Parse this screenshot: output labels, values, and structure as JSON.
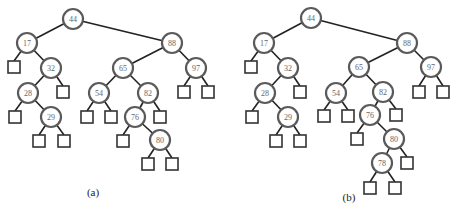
{
  "figure": {
    "trees": [
      {
        "label": "(a)",
        "label_pos": [
          93,
          196
        ],
        "nodes": [
          {
            "id": "44",
            "label": "44",
            "x": 73,
            "y": 19
          },
          {
            "id": "17",
            "label": "17",
            "x": 27,
            "y": 43
          },
          {
            "id": "32",
            "label": "32",
            "x": 51,
            "y": 68
          },
          {
            "id": "28",
            "label": "28",
            "x": 28,
            "y": 93
          },
          {
            "id": "29",
            "label": "29",
            "x": 51,
            "y": 117
          },
          {
            "id": "88",
            "label": "88",
            "x": 172,
            "y": 43
          },
          {
            "id": "65",
            "label": "65",
            "x": 123,
            "y": 68
          },
          {
            "id": "97",
            "label": "97",
            "x": 196,
            "y": 68
          },
          {
            "id": "54",
            "label": "54",
            "x": 99,
            "y": 93
          },
          {
            "id": "82",
            "label": "82",
            "x": 148,
            "y": 93
          },
          {
            "id": "76",
            "label": "76",
            "x": 135,
            "y": 117
          },
          {
            "id": "80",
            "label": "80",
            "x": 160,
            "y": 140
          }
        ],
        "leaves": [
          {
            "parent": "17",
            "x": 14,
            "y": 67
          },
          {
            "parent": "32",
            "x": 63,
            "y": 92
          },
          {
            "parent": "28",
            "x": 15,
            "y": 117
          },
          {
            "parent": "29",
            "x": 39,
            "y": 141
          },
          {
            "parent": "29",
            "x": 64,
            "y": 141
          },
          {
            "parent": "97",
            "x": 184,
            "y": 92
          },
          {
            "parent": "97",
            "x": 208,
            "y": 92
          },
          {
            "parent": "54",
            "x": 87,
            "y": 117
          },
          {
            "parent": "54",
            "x": 111,
            "y": 117
          },
          {
            "parent": "82",
            "x": 160,
            "y": 117
          },
          {
            "parent": "76",
            "x": 123,
            "y": 141
          },
          {
            "parent": "80",
            "x": 148,
            "y": 164
          },
          {
            "parent": "80",
            "x": 172,
            "y": 164
          }
        ],
        "edges": [
          [
            "44",
            "17"
          ],
          [
            "44",
            "88"
          ],
          [
            "17",
            "32"
          ],
          [
            "32",
            "28"
          ],
          [
            "28",
            "29"
          ],
          [
            "88",
            "65"
          ],
          [
            "88",
            "97"
          ],
          [
            "65",
            "54"
          ],
          [
            "65",
            "82"
          ],
          [
            "82",
            "76"
          ],
          [
            "76",
            "80"
          ]
        ]
      },
      {
        "label": "(b)",
        "label_pos": [
          349,
          201
        ],
        "nodes": [
          {
            "id": "44",
            "label": "44",
            "x": 311,
            "y": 18
          },
          {
            "id": "17",
            "label": "17",
            "x": 264,
            "y": 43
          },
          {
            "id": "32",
            "label": "32",
            "x": 288,
            "y": 68
          },
          {
            "id": "28",
            "label": "28",
            "x": 265,
            "y": 93
          },
          {
            "id": "29",
            "label": "29",
            "x": 288,
            "y": 117
          },
          {
            "id": "88",
            "label": "88",
            "x": 407,
            "y": 43
          },
          {
            "id": "65",
            "label": "65",
            "x": 359,
            "y": 67
          },
          {
            "id": "97",
            "label": "97",
            "x": 431,
            "y": 67
          },
          {
            "id": "54",
            "label": "54",
            "x": 336,
            "y": 93
          },
          {
            "id": "82",
            "label": "82",
            "x": 383,
            "y": 92
          },
          {
            "id": "76",
            "label": "76",
            "x": 370,
            "y": 115
          },
          {
            "id": "80",
            "label": "80",
            "x": 394,
            "y": 139
          },
          {
            "id": "78",
            "label": "78",
            "x": 382,
            "y": 163
          }
        ],
        "leaves": [
          {
            "parent": "17",
            "x": 251,
            "y": 67
          },
          {
            "parent": "32",
            "x": 300,
            "y": 92
          },
          {
            "parent": "28",
            "x": 252,
            "y": 117
          },
          {
            "parent": "29",
            "x": 276,
            "y": 141
          },
          {
            "parent": "29",
            "x": 300,
            "y": 141
          },
          {
            "parent": "97",
            "x": 419,
            "y": 92
          },
          {
            "parent": "97",
            "x": 443,
            "y": 92
          },
          {
            "parent": "54",
            "x": 324,
            "y": 116
          },
          {
            "parent": "54",
            "x": 348,
            "y": 116
          },
          {
            "parent": "82",
            "x": 396,
            "y": 115
          },
          {
            "parent": "76",
            "x": 357,
            "y": 139
          },
          {
            "parent": "80",
            "x": 407,
            "y": 163
          },
          {
            "parent": "78",
            "x": 370,
            "y": 188
          },
          {
            "parent": "78",
            "x": 395,
            "y": 188
          }
        ],
        "edges": [
          [
            "44",
            "17"
          ],
          [
            "44",
            "88"
          ],
          [
            "17",
            "32"
          ],
          [
            "32",
            "28"
          ],
          [
            "28",
            "29"
          ],
          [
            "88",
            "65"
          ],
          [
            "88",
            "97"
          ],
          [
            "65",
            "54"
          ],
          [
            "65",
            "82"
          ],
          [
            "82",
            "76"
          ],
          [
            "76",
            "80"
          ],
          [
            "80",
            "78"
          ]
        ]
      }
    ],
    "style": {
      "node_radius": 10,
      "leaf_size": 12,
      "edge_color": "#222222",
      "node_border_color": "#5a5a5a",
      "node_text_color": "#666666"
    }
  }
}
